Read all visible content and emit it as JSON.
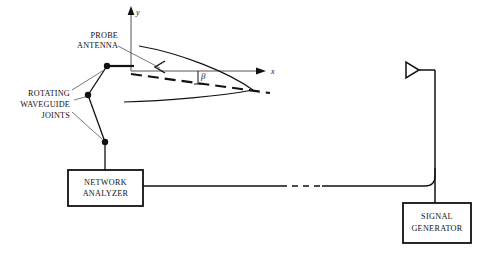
{
  "figure": {
    "title": "",
    "background": "#ffffff",
    "ink_color": "#111111",
    "thin_line_color": "#555555"
  },
  "axes": {
    "y_label": "y",
    "x_label": "x",
    "origin": {
      "x": 131,
      "y": 71
    },
    "y_tip": {
      "x": 131,
      "y": 8
    },
    "x_tip": {
      "x": 266,
      "y": 71
    }
  },
  "angle": {
    "symbol": "β",
    "description": "beam tilt angle between dashed beam axis and x-axis"
  },
  "labels": {
    "probe_antenna": [
      "PROBE",
      "ANTENNA"
    ],
    "rotating_joints": [
      "ROTATING",
      "WAVEGUIDE",
      "JOINTS"
    ]
  },
  "instruments": [
    {
      "name": "network-analyzer",
      "lines": [
        "NETWORK",
        "ANALYZER"
      ],
      "box": {
        "x": 68,
        "y": 170,
        "w": 75,
        "h": 36
      }
    },
    {
      "name": "signal-generator",
      "lines": [
        "SIGNAL",
        "GENERATOR"
      ],
      "box": {
        "x": 403,
        "y": 203,
        "w": 68,
        "h": 40
      }
    }
  ],
  "icons": {
    "horn_antenna": "horn-antenna-icon",
    "probe_marker": "probe-arrowhead-icon",
    "joint_marker": "rotating-joint-dot-icon"
  },
  "joints": [
    {
      "id": "joint-top",
      "x": 107,
      "y": 66
    },
    {
      "id": "joint-middle",
      "x": 88,
      "y": 95
    },
    {
      "id": "joint-bottom",
      "x": 105,
      "y": 142
    }
  ],
  "cable": {
    "description": "coaxial cable from network analyzer to signal generator",
    "dashed_segment": true
  }
}
